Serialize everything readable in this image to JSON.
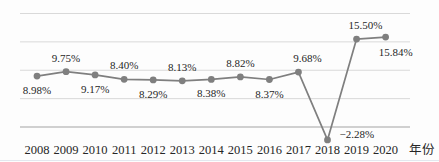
{
  "chart_data": {
    "type": "line",
    "title": "",
    "xlabel": "年份",
    "ylabel": "",
    "categories": [
      "2008",
      "2009",
      "2010",
      "2011",
      "2012",
      "2013",
      "2014",
      "2015",
      "2016",
      "2017",
      "2018",
      "2019",
      "2020"
    ],
    "values": [
      8.98,
      9.75,
      9.17,
      8.4,
      8.29,
      8.13,
      8.38,
      8.82,
      8.37,
      9.68,
      -2.28,
      15.5,
      15.84
    ],
    "point_labels": [
      "8.98%",
      "9.75%",
      "9.17%",
      "8.40%",
      "8.29%",
      "8.13%",
      "8.38%",
      "8.82%",
      "8.37%",
      "9.68%",
      "−2.28%",
      "15.50%",
      "15.84%"
    ],
    "label_placement": [
      "below",
      "above",
      "below",
      "above",
      "below",
      "above",
      "below",
      "above",
      "below",
      "above-right",
      "right",
      "above-right",
      "below-right"
    ],
    "ylim": [
      -6,
      20
    ],
    "grid": true,
    "grid_values": [
      0,
      5,
      10,
      15,
      20
    ],
    "legend_position": "none",
    "colors": {
      "line": "#7f7f7f",
      "marker": "#7f7f7f",
      "gridline": "#d9d9d9",
      "axis": "#a3a3a3",
      "point_label_text": "#1f1f1f",
      "tick_label_text": "#262626"
    }
  }
}
